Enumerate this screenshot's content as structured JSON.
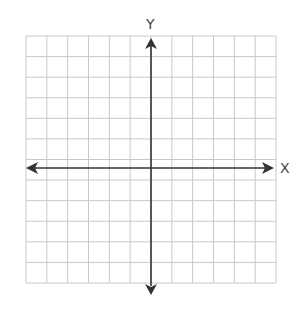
{
  "diagram": {
    "type": "coordinate-plane",
    "x_axis_label": "X",
    "y_axis_label": "Y",
    "grid": {
      "columns": 12,
      "rows": 12
    },
    "colors": {
      "grid": "#c8c8c8",
      "axis": "#333333",
      "label": "#444444"
    }
  }
}
